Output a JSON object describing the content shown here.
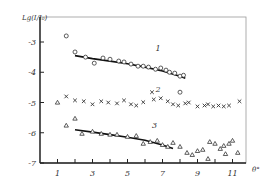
{
  "chart_data": {
    "type": "scatter",
    "title": "",
    "xlabel": "θ°",
    "ylabel": "Lg(I/I₀)",
    "xlim": [
      0,
      11.8
    ],
    "ylim": [
      -7,
      -2.2
    ],
    "x_ticks": [
      1,
      2,
      3,
      4,
      5,
      6,
      7,
      8,
      9,
      10,
      11
    ],
    "x_tick_labels": [
      {
        "value": 1,
        "label": "1"
      },
      {
        "value": 3,
        "label": "3"
      },
      {
        "value": 5,
        "label": "5"
      },
      {
        "value": 7,
        "label": "7"
      },
      {
        "value": 9,
        "label": "9"
      },
      {
        "value": 11,
        "label": "11"
      }
    ],
    "y_ticks": [
      {
        "value": -3,
        "label": "-3"
      },
      {
        "value": -4,
        "label": "-4"
      },
      {
        "value": -5,
        "label": "-5"
      },
      {
        "value": -6,
        "label": "-6"
      },
      {
        "value": -7,
        "label": "-7"
      }
    ],
    "grid": false,
    "series": [
      {
        "name": "1",
        "marker": "circle",
        "points": [
          [
            1.5,
            -2.8
          ],
          [
            2.0,
            -3.33
          ],
          [
            2.6,
            -3.5
          ],
          [
            3.1,
            -3.7
          ],
          [
            3.6,
            -3.53
          ],
          [
            4.0,
            -3.57
          ],
          [
            4.5,
            -3.63
          ],
          [
            4.8,
            -3.66
          ],
          [
            5.2,
            -3.73
          ],
          [
            5.6,
            -3.8
          ],
          [
            5.9,
            -3.8
          ],
          [
            6.2,
            -3.83
          ],
          [
            6.6,
            -3.9
          ],
          [
            6.9,
            -3.86
          ],
          [
            7.2,
            -3.93
          ],
          [
            7.4,
            -4.0
          ],
          [
            7.7,
            -4.03
          ],
          [
            8.0,
            -4.13
          ],
          [
            8.2,
            -4.1
          ],
          [
            8.0,
            -4.66
          ]
        ],
        "fit": [
          [
            2.0,
            -3.45
          ],
          [
            3.0,
            -3.55
          ],
          [
            4.0,
            -3.63
          ],
          [
            5.0,
            -3.72
          ],
          [
            6.0,
            -3.83
          ],
          [
            7.0,
            -3.96
          ],
          [
            8.0,
            -4.13
          ],
          [
            8.3,
            -4.2
          ]
        ],
        "label_pos": [
          6.6,
          -3.3
        ]
      },
      {
        "name": "2",
        "marker": "x",
        "points": [
          [
            1.5,
            -4.8
          ],
          [
            2.0,
            -4.93
          ],
          [
            2.5,
            -4.96
          ],
          [
            3.0,
            -5.06
          ],
          [
            3.5,
            -4.96
          ],
          [
            3.9,
            -5.0
          ],
          [
            4.4,
            -5.03
          ],
          [
            4.8,
            -4.93
          ],
          [
            5.2,
            -5.06
          ],
          [
            5.5,
            -5.1
          ],
          [
            5.9,
            -4.99
          ],
          [
            6.5,
            -4.9
          ],
          [
            6.9,
            -4.86
          ],
          [
            7.3,
            -4.96
          ],
          [
            7.6,
            -5.06
          ],
          [
            7.9,
            -5.1
          ],
          [
            8.3,
            -5.03
          ],
          [
            8.5,
            -5.0
          ],
          [
            9.0,
            -5.13
          ],
          [
            9.4,
            -5.1
          ],
          [
            9.6,
            -5.06
          ],
          [
            9.9,
            -5.13
          ],
          [
            10.2,
            -5.1
          ],
          [
            10.5,
            -5.13
          ],
          [
            10.8,
            -5.1
          ],
          [
            11.4,
            -4.96
          ],
          [
            6.4,
            -4.66
          ]
        ],
        "label_pos": [
          6.6,
          -4.65
        ]
      },
      {
        "name": "3",
        "marker": "triangle",
        "points": [
          [
            1.0,
            -5.0
          ],
          [
            1.5,
            -5.76
          ],
          [
            2.0,
            -5.53
          ],
          [
            2.4,
            -6.03
          ],
          [
            3.0,
            -5.96
          ],
          [
            3.5,
            -6.03
          ],
          [
            4.0,
            -6.06
          ],
          [
            4.4,
            -6.06
          ],
          [
            5.0,
            -6.13
          ],
          [
            5.5,
            -6.1
          ],
          [
            5.9,
            -6.36
          ],
          [
            6.3,
            -6.3
          ],
          [
            6.7,
            -6.26
          ],
          [
            7.0,
            -6.4
          ],
          [
            7.3,
            -6.46
          ],
          [
            7.6,
            -6.33
          ],
          [
            8.0,
            -6.46
          ],
          [
            8.4,
            -6.66
          ],
          [
            8.7,
            -6.73
          ],
          [
            9.0,
            -6.6
          ],
          [
            9.3,
            -6.56
          ],
          [
            9.7,
            -6.3
          ],
          [
            10.0,
            -6.36
          ],
          [
            10.3,
            -6.53
          ],
          [
            10.5,
            -6.43
          ],
          [
            10.8,
            -6.36
          ],
          [
            11.0,
            -6.26
          ],
          [
            11.3,
            -6.66
          ],
          [
            9.6,
            -6.86
          ],
          [
            10.6,
            -6.7
          ]
        ],
        "fit": [
          [
            2.0,
            -5.9
          ],
          [
            3.0,
            -5.98
          ],
          [
            4.0,
            -6.06
          ],
          [
            5.0,
            -6.15
          ],
          [
            6.0,
            -6.25
          ],
          [
            7.0,
            -6.4
          ],
          [
            7.6,
            -6.52
          ]
        ],
        "label_pos": [
          6.4,
          -5.85
        ]
      }
    ]
  }
}
